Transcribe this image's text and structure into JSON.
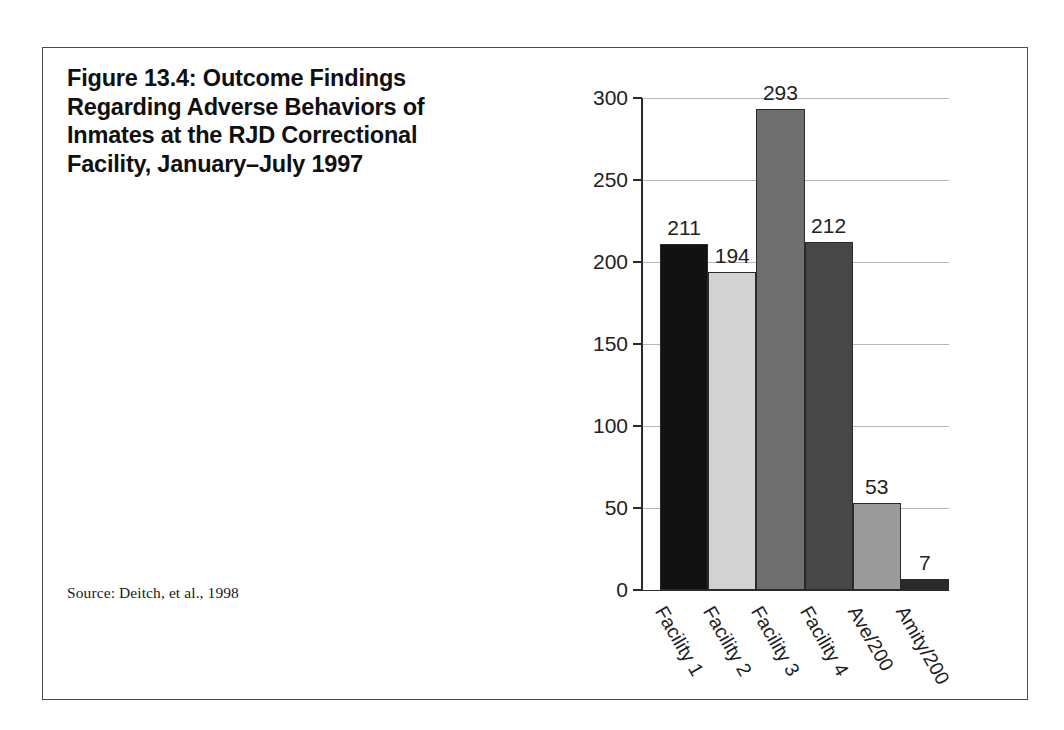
{
  "figure": {
    "title": "Figure 13.4: Outcome Findings\nRegarding Adverse Behaviors of\nInmates at the RJD Correctional\nFacility, January–July 1997",
    "source": "Source: Deitch, et al., 1998"
  },
  "chart_data": {
    "type": "bar",
    "title": "Figure 13.4: Outcome Findings Regarding Adverse Behaviors of Inmates at the RJD Correctional Facility, January–July 1997",
    "xlabel": "",
    "ylabel": "",
    "categories": [
      "Facility 1",
      "Facility 2",
      "Facility 3",
      "Facility 4",
      "Ave/200",
      "Amity/200"
    ],
    "values": [
      211,
      194,
      293,
      212,
      53,
      7
    ],
    "bar_colors": [
      "#121212",
      "#d2d2d2",
      "#6f6f6f",
      "#474747",
      "#9b9b9b",
      "#2a2a2a"
    ],
    "ylim": [
      0,
      300
    ],
    "yticks": [
      0,
      50,
      100,
      150,
      200,
      250,
      300
    ],
    "ytick_labels": [
      "0",
      "50",
      "100",
      "150",
      "200",
      "250",
      "300"
    ],
    "grid": true,
    "grid_axis": "y",
    "legend": false,
    "data_labels": [
      "211",
      "194",
      "293",
      "212",
      "53",
      "7"
    ],
    "xtick_rotation": -60
  }
}
